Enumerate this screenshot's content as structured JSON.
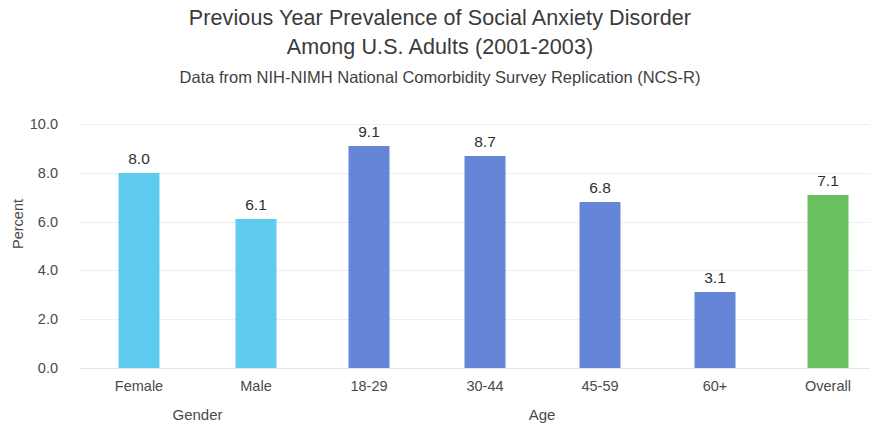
{
  "chart_data": {
    "type": "bar",
    "title": "Previous Year Prevalence of Social Anxiety Disorder Among U.S. Adults (2001-2003)",
    "title_lines": [
      "Previous Year Prevalence of Social Anxiety Disorder",
      "Among U.S. Adults (2001-2003)"
    ],
    "subtitle": "Data from NIH-NIMH National Comorbidity Survey Replication (NCS-R)",
    "xlabel": "",
    "ylabel": "Percent",
    "ylim": [
      0,
      10
    ],
    "ytick_step": 2,
    "ytick_labels": [
      "10.0",
      "8.0",
      "6.0",
      "4.0",
      "2.0",
      "0.0"
    ],
    "ytick_values": [
      10,
      8,
      6,
      4,
      2,
      0
    ],
    "grid": true,
    "legend": "none",
    "categories": [
      "Female",
      "Male",
      "18-29",
      "30-44",
      "45-59",
      "60+",
      "Overall"
    ],
    "values": [
      8.0,
      6.1,
      9.1,
      8.7,
      6.8,
      3.1,
      7.1
    ],
    "value_labels": [
      "8.0",
      "6.1",
      "9.1",
      "8.7",
      "6.8",
      "3.1",
      "7.1"
    ],
    "bar_colors": [
      "#5ECBEF",
      "#5ECBEF",
      "#6585D8",
      "#6585D8",
      "#6585D8",
      "#6585D8",
      "#6ABF5E"
    ],
    "groups": [
      {
        "label": "Gender",
        "categories": [
          "Female",
          "Male"
        ]
      },
      {
        "label": "Age",
        "categories": [
          "18-29",
          "30-44",
          "45-59",
          "60+"
        ]
      }
    ],
    "group_labels": [
      "Gender",
      "Age"
    ],
    "colors": {
      "light_blue": "#5ECBEF",
      "medium_blue": "#6585D8",
      "green": "#6ABF5E",
      "gridline": "#eceff1",
      "text": "#4a4a4a",
      "background": "#ffffff"
    }
  }
}
